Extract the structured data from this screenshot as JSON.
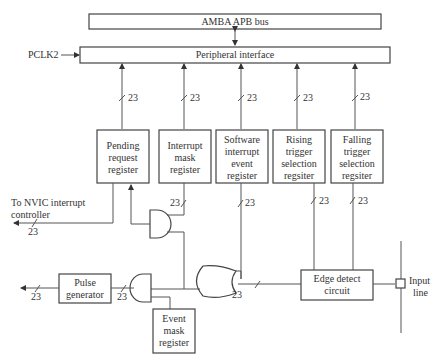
{
  "diagram": {
    "bus": {
      "label": "AMBA APB bus"
    },
    "peripheral": {
      "label": "Peripheral interface",
      "clock_label": "PCLK2"
    },
    "registers": [
      {
        "id": "pending",
        "lines": [
          "Pending",
          "request",
          "register"
        ]
      },
      {
        "id": "interrupt-mask",
        "lines": [
          "Interrupt",
          "mask",
          "register"
        ]
      },
      {
        "id": "software-interrupt",
        "lines": [
          "Software",
          "interrupt",
          "event",
          "register"
        ]
      },
      {
        "id": "rising-trigger",
        "lines": [
          "Rising",
          "trigger",
          "selection",
          "regsiter"
        ]
      },
      {
        "id": "falling-trigger",
        "lines": [
          "Falling",
          "trigger",
          "selection",
          "regsiter"
        ]
      }
    ],
    "bus_width": "23",
    "nvic": {
      "lines": [
        "To NVIC interrupt",
        "controller"
      ]
    },
    "pulse_generator": {
      "lines": [
        "Pulse",
        "generator"
      ]
    },
    "event_mask": {
      "lines": [
        "Event",
        "mask",
        "register"
      ]
    },
    "edge_detect": {
      "lines": [
        "Edge detect",
        "circuit"
      ]
    },
    "input_line": {
      "lines": [
        "Input",
        "line"
      ]
    },
    "caption": "",
    "colors": {
      "stroke": "#444444",
      "text": "#333333",
      "background": "#ffffff"
    }
  }
}
